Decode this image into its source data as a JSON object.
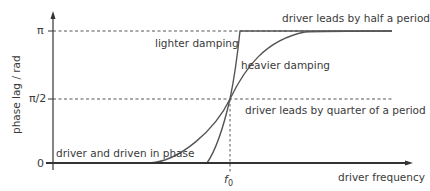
{
  "diagram": {
    "type": "phase-lag vs driver frequency (forced oscillation resonance)",
    "y_axis": {
      "label": "phase lag / rad",
      "ticks": [
        {
          "label": "π",
          "value": "pi"
        },
        {
          "label": "π/2",
          "value": "pi/2"
        },
        {
          "label": "0",
          "value": "0"
        }
      ]
    },
    "x_axis": {
      "label": "driver frequency",
      "marker": {
        "symbol": "f",
        "subscript": "0"
      }
    },
    "annotations": {
      "half_period": "driver leads by half a period",
      "quarter_period": "driver leads by quarter of a period",
      "in_phase": "driver and driven in phase",
      "lighter": "lighter damping",
      "heavier": "heavier damping"
    },
    "colors": {
      "line": "#555555",
      "text": "#3a3a3a",
      "axis": "#333333"
    }
  }
}
